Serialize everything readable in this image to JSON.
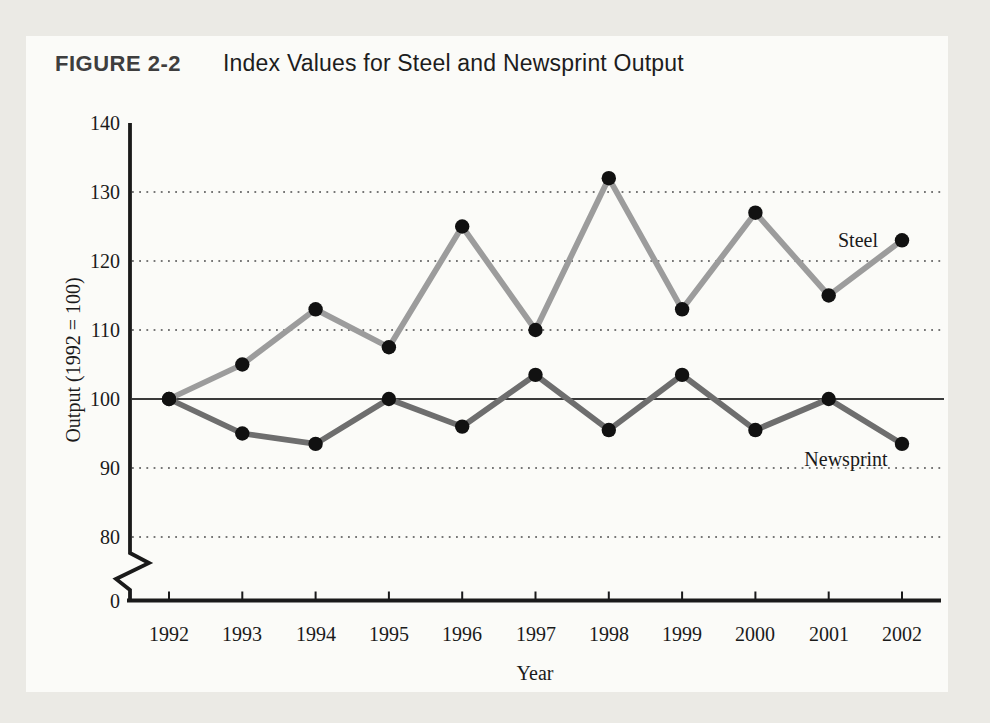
{
  "page": {
    "background": "#ebeae5",
    "panel_background": "#fbfbf8"
  },
  "figure": {
    "label": "FIGURE 2-2",
    "title": "Index Values for Steel and Newsprint Output"
  },
  "colors": {
    "figure_label": "#3e3e3e",
    "figure_title": "#1d1d1d",
    "axis": "#1a1a1a",
    "grid_dots": "#4b4b4b",
    "baseline_100": "#3a3a3a",
    "marker": "#111111",
    "text": "#1a1a1a"
  },
  "chart_data": {
    "type": "line",
    "title": "Index Values for Steel and Newsprint Output",
    "xlabel": "Year",
    "ylabel": "Output (1992 = 100)",
    "categories": [
      "1992",
      "1993",
      "1994",
      "1995",
      "1996",
      "1997",
      "1998",
      "1999",
      "2000",
      "2001",
      "2002"
    ],
    "series": [
      {
        "name": "Steel",
        "color": "#9c9c9c",
        "values": [
          100,
          105,
          113,
          107.5,
          125,
          110,
          132,
          113,
          127,
          115,
          123
        ]
      },
      {
        "name": "Newsprint",
        "color": "#6e6e6e",
        "values": [
          100,
          95,
          93.5,
          100,
          96,
          103.5,
          95.5,
          103.5,
          95.5,
          100,
          93.5
        ]
      }
    ],
    "y_ticks": [
      140,
      130,
      120,
      110,
      100,
      90,
      80,
      0
    ],
    "dotted_gridlines_at": [
      130,
      120,
      110,
      90,
      80
    ],
    "solid_gridline_at": 100,
    "axis_break_between": [
      0,
      80
    ],
    "ylim_display": [
      80,
      140
    ],
    "grid": "dotted horizontal",
    "legend_position": "inline-labels",
    "marker": "filled black circle"
  }
}
